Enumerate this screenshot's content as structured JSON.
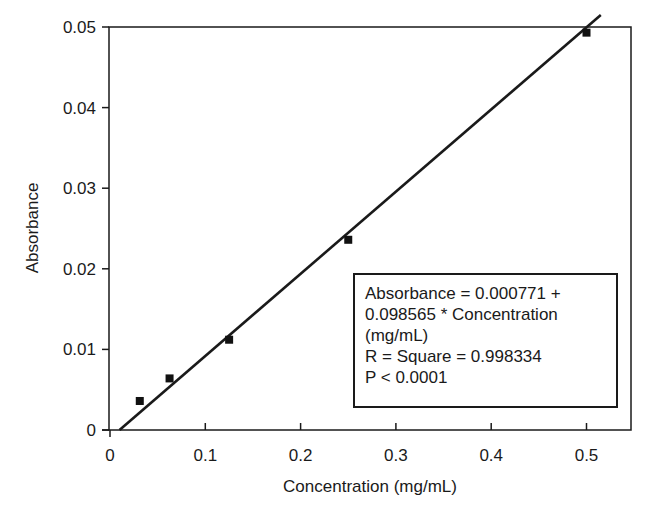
{
  "chart_data": {
    "type": "scatter",
    "title": "",
    "xlabel": "Concentration (mg/mL)",
    "ylabel": "Absorbance",
    "xlim": [
      0,
      0.55
    ],
    "ylim": [
      0,
      0.05
    ],
    "x_ticks": [
      "0",
      "0.1",
      "0.2",
      "0.3",
      "0.4",
      "0.5"
    ],
    "y_ticks": [
      "0",
      "0.01",
      "0.02",
      "0.03",
      "0.04",
      "0.05"
    ],
    "grid": false,
    "legend": null,
    "series": [
      {
        "name": "Measured",
        "marker": "square",
        "x": [
          0.03125,
          0.0625,
          0.125,
          0.25,
          0.5
        ],
        "y": [
          0.0036,
          0.0064,
          0.0112,
          0.0236,
          0.0493
        ]
      },
      {
        "name": "Linear fit",
        "type": "line",
        "intercept": 0.000771,
        "slope": 0.098565,
        "x": [
          0.01,
          0.515
        ],
        "y": [
          0.0,
          0.0515
        ]
      }
    ],
    "annotations": [
      "Absorbance = 0.000771 +",
      "0.098565 * Concentration",
      "(mg/mL)",
      "R = Square = 0.998334",
      "P < 0.0001"
    ]
  }
}
